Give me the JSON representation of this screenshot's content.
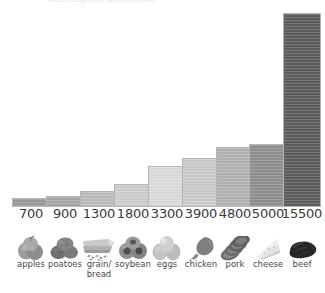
{
  "header": {
    "clipped_text": "Water footprint of selected foods"
  },
  "chart_data": {
    "type": "bar",
    "title": "Water footprint of selected foods",
    "xlabel": "",
    "ylabel": "",
    "ylim": [
      0,
      15500
    ],
    "grid": false,
    "legend": false,
    "categories": [
      "apples",
      "poatoes",
      "grain/\nbread",
      "soybean",
      "eggs",
      "chicken",
      "pork",
      "cheese",
      "beef"
    ],
    "values": [
      700,
      900,
      1300,
      1800,
      3300,
      3900,
      4800,
      5000,
      15500
    ],
    "value_labels": [
      "700",
      "900",
      "1300",
      "1800",
      "3300",
      "3900",
      "4800",
      "5000",
      "15500"
    ],
    "bar_colors": [
      "#9a9a9a",
      "#a8a8a8",
      "#bdbdbd",
      "#cfcfcf",
      "#dcdcdc",
      "#cdcdcd",
      "#b4b4b4",
      "#909090",
      "#5e5e5e"
    ]
  },
  "bars": [
    {
      "label": "apples",
      "label_line2": "",
      "value": 700,
      "value_label": "700",
      "color": "#9a9a9a",
      "icon": "apples-icon"
    },
    {
      "label": "poatoes",
      "label_line2": "",
      "value": 900,
      "value_label": "900",
      "color": "#a8a8a8",
      "icon": "potatoes-icon"
    },
    {
      "label": "grain/",
      "label_line2": "bread",
      "value": 1300,
      "value_label": "1300",
      "color": "#bdbdbd",
      "icon": "grain-bread-icon"
    },
    {
      "label": "soybean",
      "label_line2": "",
      "value": 1800,
      "value_label": "1800",
      "color": "#cfcfcf",
      "icon": "soybean-icon"
    },
    {
      "label": "eggs",
      "label_line2": "",
      "value": 3300,
      "value_label": "3300",
      "color": "#dcdcdc",
      "icon": "eggs-icon"
    },
    {
      "label": "chicken",
      "label_line2": "",
      "value": 3900,
      "value_label": "3900",
      "color": "#cdcdcd",
      "icon": "chicken-icon"
    },
    {
      "label": "pork",
      "label_line2": "",
      "value": 4800,
      "value_label": "4800",
      "color": "#b4b4b4",
      "icon": "pork-icon"
    },
    {
      "label": "cheese",
      "label_line2": "",
      "value": 5000,
      "value_label": "5000",
      "color": "#909090",
      "icon": "cheese-icon"
    },
    {
      "label": "beef",
      "label_line2": "",
      "value": 15500,
      "value_label": "15500",
      "color": "#5e5e5e",
      "icon": "beef-icon"
    }
  ],
  "layout": {
    "baseline_y": 206,
    "max_bar_height": 194,
    "bar_slots": [
      {
        "x": 12,
        "w": 38
      },
      {
        "x": 46,
        "w": 38
      },
      {
        "x": 80,
        "w": 38
      },
      {
        "x": 114,
        "w": 38
      },
      {
        "x": 148,
        "w": 38
      },
      {
        "x": 182,
        "w": 38
      },
      {
        "x": 216,
        "w": 38
      },
      {
        "x": 249,
        "w": 38
      },
      {
        "x": 283,
        "w": 38
      }
    ]
  }
}
